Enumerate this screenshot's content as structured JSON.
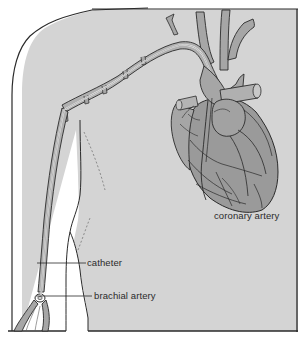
{
  "figure": {
    "colors": {
      "background": "#ffffff",
      "body_fill": "#d4d4d4",
      "heart_fill": "#9a9a9a",
      "vessel_fill": "#a6a6a6",
      "outline": "#2a2a2a",
      "catheter_highlight": "#f2f2f2",
      "arm_gap": "#ffffff"
    },
    "labels": {
      "coronary_artery": "coronary artery",
      "catheter": "catheter",
      "brachial_artery": "brachial artery"
    }
  }
}
